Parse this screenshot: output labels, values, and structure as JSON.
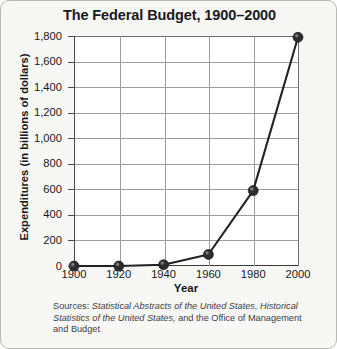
{
  "chart_data": {
    "type": "line",
    "title": "The Federal Budget, 1900–2000",
    "xlabel": "Year",
    "ylabel": "Expenditures (in billions of dollars)",
    "x": [
      1900,
      1920,
      1940,
      1960,
      1980,
      2000
    ],
    "categories": [
      "1900",
      "1920",
      "1940",
      "1960",
      "1980",
      "2000"
    ],
    "values": [
      0,
      0,
      10,
      90,
      590,
      1790
    ],
    "series": [
      {
        "name": "Federal budget expenditures",
        "values": [
          0,
          0,
          10,
          90,
          590,
          1790
        ]
      }
    ],
    "xlim": [
      1900,
      2000
    ],
    "ylim": [
      0,
      1800
    ],
    "ytick_values": [
      0,
      200,
      400,
      600,
      800,
      1000,
      1200,
      1400,
      1600,
      1800
    ],
    "ytick_labels": [
      "0",
      "200",
      "400",
      "600",
      "800",
      "1,000",
      "1,200",
      "1,400",
      "1,600",
      "1,800"
    ],
    "xtick_labels": [
      "1900",
      "1920",
      "1940",
      "1960",
      "1980",
      "2000"
    ],
    "grid": "horizontal-and-vertical",
    "legend": "none",
    "marker": "filled-circle",
    "line_color": "#222224",
    "marker_color": "#2c2c2e",
    "grid_color": "#9d9d9f"
  },
  "source_note": {
    "prefix": "Sources:",
    "italic_1": "Statistical Abstracts of the United States,",
    "italic_2": "Historical Statistics of the United States,",
    "suffix": "and the Office of Management and Budget",
    "full_text": "Sources: Statistical Abstracts of the United States, Historical Statistics of the United States, and the Office of Management and Budget"
  }
}
